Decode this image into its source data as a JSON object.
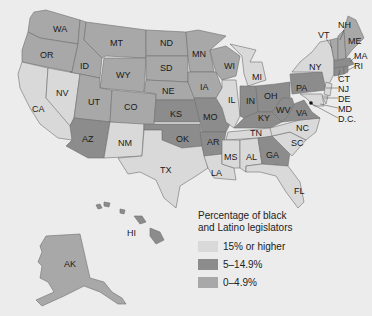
{
  "legend": {
    "title_line1": "Percentage of black",
    "title_line2": "and Latino legislators",
    "items": [
      {
        "label": "15% or higher",
        "color": "#d9d9d9"
      },
      {
        "label": "5–14.9%",
        "color": "#8c8c8c"
      },
      {
        "label": "0–4.9%",
        "color": "#a8a8a8"
      }
    ]
  },
  "colors": {
    "high": "#d9d9d9",
    "mid": "#8c8c8c",
    "low": "#a8a8a8",
    "background": "#ececec"
  },
  "states": {
    "WA": {
      "label": "WA",
      "category": "low"
    },
    "OR": {
      "label": "OR",
      "category": "low"
    },
    "ID": {
      "label": "ID",
      "category": "low"
    },
    "MT": {
      "label": "MT",
      "category": "low"
    },
    "WY": {
      "label": "WY",
      "category": "low"
    },
    "ND": {
      "label": "ND",
      "category": "low"
    },
    "SD": {
      "label": "SD",
      "category": "low"
    },
    "NE": {
      "label": "NE",
      "category": "low"
    },
    "MN": {
      "label": "MN",
      "category": "low"
    },
    "IA": {
      "label": "IA",
      "category": "low"
    },
    "UT": {
      "label": "UT",
      "category": "low"
    },
    "CO": {
      "label": "CO",
      "category": "low"
    },
    "WI": {
      "label": "WI",
      "category": "low"
    },
    "CA": {
      "label": "CA",
      "category": "high"
    },
    "NV": {
      "label": "NV",
      "category": "high"
    },
    "NM": {
      "label": "NM",
      "category": "high"
    },
    "TX": {
      "label": "TX",
      "category": "high"
    },
    "IL": {
      "label": "IL",
      "category": "high"
    },
    "MI": {
      "label": "MI",
      "category": "high"
    },
    "NY": {
      "label": "NY",
      "category": "high"
    },
    "LA": {
      "label": "LA",
      "category": "high"
    },
    "MS": {
      "label": "MS",
      "category": "high"
    },
    "AL": {
      "label": "AL",
      "category": "high"
    },
    "TN": {
      "label": "TN",
      "category": "high"
    },
    "NC": {
      "label": "NC",
      "category": "high"
    },
    "SC": {
      "label": "SC",
      "category": "high"
    },
    "FL": {
      "label": "FL",
      "category": "high"
    },
    "NJ": {
      "label": "NJ",
      "category": "high"
    },
    "MD": {
      "label": "MD",
      "category": "high"
    },
    "DE": {
      "label": "DE",
      "category": "high"
    },
    "DC": {
      "label": "D.C.",
      "category": "high"
    },
    "AZ": {
      "label": "AZ",
      "category": "mid"
    },
    "KS": {
      "label": "KS",
      "category": "mid"
    },
    "OK": {
      "label": "OK",
      "category": "mid"
    },
    "MO": {
      "label": "MO",
      "category": "mid"
    },
    "AR": {
      "label": "AR",
      "category": "mid"
    },
    "IN": {
      "label": "IN",
      "category": "mid"
    },
    "OH": {
      "label": "OH",
      "category": "mid"
    },
    "KY": {
      "label": "KY",
      "category": "mid"
    },
    "WV": {
      "label": "WV",
      "category": "mid"
    },
    "VA": {
      "label": "VA",
      "category": "mid"
    },
    "PA": {
      "label": "PA",
      "category": "mid"
    },
    "GA": {
      "label": "GA",
      "category": "mid"
    },
    "CT": {
      "label": "CT",
      "category": "mid"
    },
    "MA": {
      "label": "MA",
      "category": "mid"
    },
    "RI": {
      "label": "RI",
      "category": "mid"
    },
    "NH": {
      "label": "NH",
      "category": "low"
    },
    "VT": {
      "label": "VT",
      "category": "low"
    },
    "ME": {
      "label": "ME",
      "category": "low"
    },
    "AK": {
      "label": "AK",
      "category": "low"
    },
    "HI": {
      "label": "HI",
      "category": "mid"
    }
  }
}
